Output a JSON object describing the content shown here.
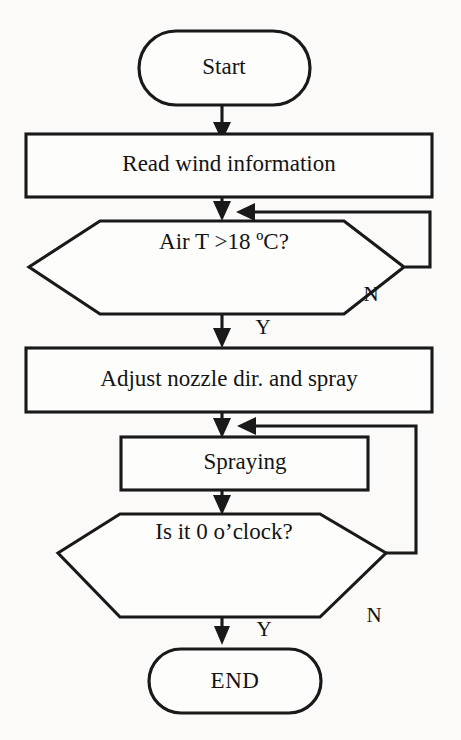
{
  "diagram": {
    "type": "flowchart",
    "background_color": "#fbfaf8",
    "line_color": "#191919",
    "fill_color": "#fdfdfc",
    "nodes": [
      {
        "id": "start",
        "shape": "terminal",
        "label": "Start"
      },
      {
        "id": "read",
        "shape": "process",
        "label": "Read wind information"
      },
      {
        "id": "airt",
        "shape": "decision",
        "label": "Air T >18 ºC?"
      },
      {
        "id": "adjust",
        "shape": "process",
        "label": "Adjust nozzle dir. and spray"
      },
      {
        "id": "spray",
        "shape": "process",
        "label": "Spraying"
      },
      {
        "id": "clock",
        "shape": "decision",
        "label": "Is it 0 o’clock?"
      },
      {
        "id": "end",
        "shape": "terminal",
        "label": "END"
      }
    ],
    "edges": [
      {
        "from": "start",
        "to": "read",
        "label": ""
      },
      {
        "from": "read",
        "to": "airt",
        "label": ""
      },
      {
        "from": "airt",
        "to": "adjust",
        "label": "Y"
      },
      {
        "from": "airt",
        "to": "airt",
        "label": "N"
      },
      {
        "from": "adjust",
        "to": "spray",
        "label": ""
      },
      {
        "from": "spray",
        "to": "clock",
        "label": ""
      },
      {
        "from": "clock",
        "to": "end",
        "label": "Y"
      },
      {
        "from": "clock",
        "to": "spray",
        "label": "N"
      }
    ],
    "edge_labels": {
      "airt_yes": "Y",
      "airt_no": "N",
      "clock_yes": "Y",
      "clock_no": "N"
    }
  }
}
